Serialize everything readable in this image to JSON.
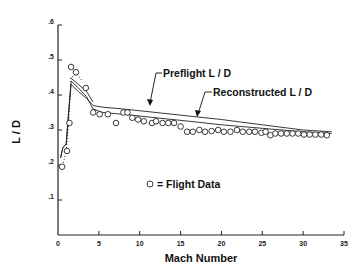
{
  "chart_data": {
    "type": "line",
    "title": "",
    "xlabel": "Mach Number",
    "ylabel": "L / D",
    "xlim": [
      0,
      35
    ],
    "ylim": [
      0,
      0.6
    ],
    "xticks": [
      0,
      5,
      10,
      15,
      20,
      25,
      30,
      35
    ],
    "xtick_labels": [
      "0",
      "5",
      "10",
      "15",
      "20",
      "25",
      "30",
      "35"
    ],
    "yticks": [
      0.1,
      0.2,
      0.3,
      0.4,
      0.5,
      0.6
    ],
    "ytick_labels": [
      ".1",
      ".2",
      ".3",
      ".4",
      ".5",
      ".6"
    ],
    "grid": false,
    "series": [
      {
        "name": "Preflight L / D",
        "style": "solid",
        "x": [
          0.3,
          0.6,
          1.0,
          1.3,
          1.6,
          2.5,
          3.5,
          4.3,
          5.5,
          8,
          12,
          16,
          20,
          25,
          30,
          33.5
        ],
        "y": [
          0.22,
          0.25,
          0.26,
          0.35,
          0.43,
          0.41,
          0.39,
          0.37,
          0.365,
          0.36,
          0.35,
          0.34,
          0.33,
          0.315,
          0.3,
          0.295
        ]
      },
      {
        "name": "Reconstructed L / D",
        "style": "solid",
        "x": [
          0.3,
          0.6,
          1.0,
          1.3,
          1.6,
          2.5,
          3.5,
          4.3,
          5.5,
          8,
          12,
          16,
          20,
          25,
          30,
          33.5
        ],
        "y": [
          0.22,
          0.25,
          0.26,
          0.35,
          0.44,
          0.42,
          0.395,
          0.36,
          0.35,
          0.345,
          0.335,
          0.325,
          0.315,
          0.305,
          0.295,
          0.29
        ]
      },
      {
        "name": "Upper bound",
        "style": "solid",
        "x": [
          1.5,
          2.5,
          3.5,
          4.3
        ],
        "y": [
          0.45,
          0.43,
          0.41,
          0.38
        ]
      },
      {
        "name": "Dotted trend",
        "style": "dotted",
        "x": [
          0.5,
          1.0,
          1.3,
          1.6,
          2.3,
          3.0
        ],
        "y": [
          0.19,
          0.24,
          0.32,
          0.45,
          0.46,
          0.44
        ]
      }
    ],
    "flight_data": {
      "name": "Flight Data",
      "x": [
        0.5,
        1.1,
        1.4,
        1.6,
        2.2,
        3.4,
        4.3,
        5.1,
        6.1,
        7.1,
        8.0,
        8.5,
        9.1,
        9.8,
        10.5,
        11.5,
        12.0,
        12.8,
        13.5,
        14.2,
        15.0,
        15.8,
        16.5,
        17.3,
        18.0,
        18.8,
        19.6,
        20.3,
        21.1,
        21.9,
        22.6,
        23.4,
        24.1,
        24.9,
        25.4,
        26.0,
        26.6,
        27.3,
        28.0,
        28.7,
        29.4,
        30.1,
        30.8,
        31.5,
        32.2,
        32.9
      ],
      "y": [
        0.195,
        0.24,
        0.32,
        0.48,
        0.465,
        0.42,
        0.35,
        0.345,
        0.345,
        0.32,
        0.35,
        0.35,
        0.335,
        0.33,
        0.325,
        0.32,
        0.325,
        0.32,
        0.32,
        0.32,
        0.31,
        0.295,
        0.295,
        0.3,
        0.295,
        0.297,
        0.3,
        0.295,
        0.295,
        0.3,
        0.295,
        0.295,
        0.295,
        0.292,
        0.295,
        0.285,
        0.29,
        0.29,
        0.29,
        0.29,
        0.29,
        0.287,
        0.287,
        0.287,
        0.287,
        0.285
      ]
    },
    "annotations": [
      {
        "text": "Preflight L / D",
        "target_x": 15,
        "target_y": 0.345
      },
      {
        "text": "Reconstructed L / D",
        "target_x": 17.5,
        "target_y": 0.323
      },
      {
        "text": "= Flight Data",
        "marker": "circle"
      }
    ]
  }
}
